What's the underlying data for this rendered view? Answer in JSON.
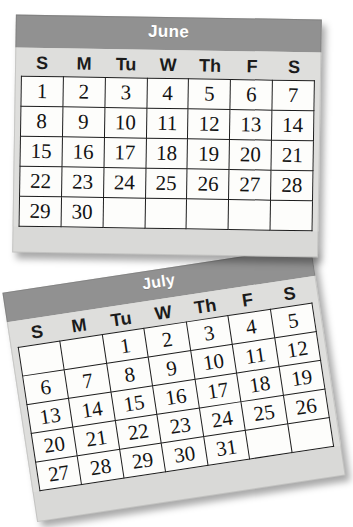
{
  "page": {
    "background_color": "#ffffff"
  },
  "theme": {
    "header_bar_color": "#919191",
    "header_text_color": "#ffffff",
    "card_body_color": "#dededc",
    "cell_background_color": "#fdfdfb",
    "cell_border_color": "#1d1d1d",
    "date_text_color": "#131313",
    "shadow_color": "rgba(0,0,0,0.34)"
  },
  "calendars": [
    {
      "id": "june",
      "title": "June",
      "rotation_deg": 0.9,
      "day_headers": [
        "S",
        "M",
        "Tu",
        "W",
        "Th",
        "F",
        "S"
      ],
      "weeks": [
        [
          "1",
          "2",
          "3",
          "4",
          "5",
          "6",
          "7"
        ],
        [
          "8",
          "9",
          "10",
          "11",
          "12",
          "13",
          "14"
        ],
        [
          "15",
          "16",
          "17",
          "18",
          "19",
          "20",
          "21"
        ],
        [
          "22",
          "23",
          "24",
          "25",
          "26",
          "27",
          "28"
        ],
        [
          "29",
          "30",
          "",
          "",
          "",
          "",
          ""
        ]
      ],
      "first_day_weekday": "S",
      "days_in_month": 30
    },
    {
      "id": "july",
      "title": "July",
      "rotation_deg": -8.6,
      "day_headers": [
        "S",
        "M",
        "Tu",
        "W",
        "Th",
        "F",
        "S"
      ],
      "weeks": [
        [
          "",
          "",
          "1",
          "2",
          "3",
          "4",
          "5"
        ],
        [
          "6",
          "7",
          "8",
          "9",
          "10",
          "11",
          "12"
        ],
        [
          "13",
          "14",
          "15",
          "16",
          "17",
          "18",
          "19"
        ],
        [
          "20",
          "21",
          "22",
          "23",
          "24",
          "25",
          "26"
        ],
        [
          "27",
          "28",
          "29",
          "30",
          "31",
          "",
          ""
        ]
      ],
      "first_day_weekday": "Tu",
      "days_in_month": 31
    }
  ]
}
